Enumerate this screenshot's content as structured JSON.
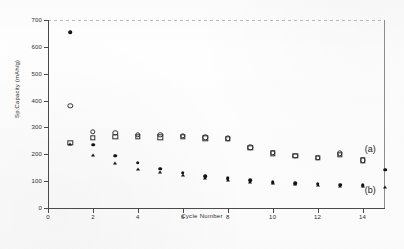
{
  "chart_data": {
    "type": "scatter",
    "title": "",
    "xlabel": "Cycle Number",
    "ylabel": "Sp.Capacity (mAh/g)",
    "xlim": [
      0,
      15
    ],
    "ylim": [
      0,
      700
    ],
    "xticks": [
      0,
      2,
      4,
      6,
      8,
      10,
      12,
      14
    ],
    "yticks": [
      0,
      100,
      200,
      300,
      400,
      500,
      600,
      700
    ],
    "grid": false,
    "legend_position": "inline-annotations",
    "annotations": [
      {
        "text": "(a)",
        "series": "a",
        "x": 14.1,
        "y": 215
      },
      {
        "text": "(b)",
        "series": "b",
        "x": 14.1,
        "y": 62
      }
    ],
    "series": [
      {
        "name": "(a) charge capacity",
        "group": "a",
        "marker": "open-circle",
        "x": [
          1,
          2,
          3,
          4,
          5,
          6,
          7,
          8,
          9,
          10,
          11,
          12,
          13,
          14
        ],
        "values": [
          380,
          283,
          280,
          273,
          272,
          268,
          263,
          260,
          226,
          205,
          195,
          188,
          203,
          178
        ]
      },
      {
        "name": "(a) discharge capacity",
        "group": "a",
        "marker": "open-square",
        "x": [
          1,
          2,
          3,
          4,
          5,
          6,
          7,
          8,
          9,
          10,
          11,
          12,
          13,
          14
        ],
        "values": [
          243,
          262,
          265,
          266,
          263,
          264,
          259,
          258,
          224,
          203,
          194,
          187,
          199,
          177
        ]
      },
      {
        "name": "(b) charge capacity",
        "group": "b",
        "marker": "filled-circle",
        "x": [
          1,
          2,
          3,
          4,
          5,
          6,
          7,
          8,
          9,
          10,
          11,
          12,
          13,
          14,
          15
        ],
        "values": [
          655,
          236,
          194,
          168,
          147,
          131,
          118,
          110,
          103,
          97,
          93,
          90,
          86,
          85,
          143
        ]
      },
      {
        "name": "(b) discharge capacity",
        "group": "b",
        "marker": "filled-triangle",
        "x": [
          1,
          2,
          3,
          4,
          5,
          6,
          7,
          8,
          9,
          10,
          11,
          12,
          13,
          14,
          15
        ],
        "values": [
          237,
          196,
          168,
          147,
          134,
          124,
          113,
          104,
          98,
          94,
          90,
          87,
          83,
          82,
          80
        ]
      }
    ]
  },
  "axis": {
    "x_title": "Cycle Number",
    "y_title": "Sp.Capacity (mAh/g)",
    "x_ticklabels": [
      "0",
      "2",
      "4",
      "6",
      "8",
      "10",
      "12",
      "14"
    ],
    "y_ticklabels": [
      "0",
      "100",
      "200",
      "300",
      "400",
      "500",
      "600",
      "700"
    ]
  },
  "labels": {
    "series_a": "(a)",
    "series_b": "(b)"
  },
  "colors": {
    "marker": "#141414",
    "axis": "#4a4a4a",
    "background": "#fefefe"
  }
}
